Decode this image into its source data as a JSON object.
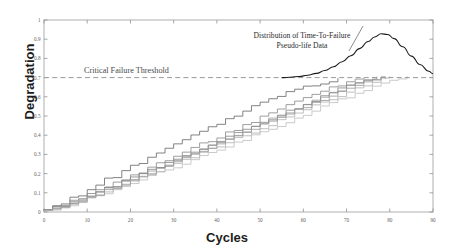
{
  "chart_data": {
    "type": "line",
    "title": "",
    "xlabel": "Cycles",
    "ylabel": "Degradation",
    "xlim": [
      0,
      90
    ],
    "ylim": [
      0,
      1
    ],
    "xticks": [
      0,
      10,
      20,
      30,
      40,
      50,
      60,
      70,
      80,
      90
    ],
    "yticks": [
      0,
      0.1,
      0.2,
      0.3,
      0.4,
      0.5,
      0.6,
      0.7,
      0.8,
      0.9,
      1
    ],
    "xtick_labels": [
      "0",
      "10",
      "20",
      "30",
      "40",
      "50",
      "60",
      "70",
      "80",
      "90"
    ],
    "ytick_labels": [
      "0",
      "0.1",
      "0.2",
      "0.3",
      "0.4",
      "0.5",
      "0.6",
      "0.7",
      "0.8",
      "0.9",
      "1"
    ],
    "grid": false,
    "legend": "none",
    "threshold": {
      "label": "Critical Failure Threshold",
      "value": 0.7,
      "style": "dashed",
      "color": "#9a9a9a"
    },
    "annotation": {
      "line1": "Distribution of Time-To-Failure",
      "line2": "Pseudo-life Data",
      "color": "#2b2b2b"
    },
    "distribution_curve": {
      "name": "Time-To-Failure density",
      "color": "#1a1a1a",
      "peak_x": 78,
      "peak_y": 0.93,
      "points": [
        [
          55,
          0.7
        ],
        [
          57,
          0.702
        ],
        [
          59,
          0.706
        ],
        [
          61,
          0.712
        ],
        [
          63,
          0.722
        ],
        [
          65,
          0.737
        ],
        [
          67,
          0.757
        ],
        [
          69,
          0.783
        ],
        [
          71,
          0.814
        ],
        [
          73,
          0.851
        ],
        [
          75,
          0.888
        ],
        [
          76.5,
          0.912
        ],
        [
          78,
          0.928
        ],
        [
          79.5,
          0.925
        ],
        [
          81,
          0.903
        ],
        [
          83,
          0.861
        ],
        [
          85,
          0.812
        ],
        [
          87,
          0.768
        ],
        [
          89,
          0.733
        ],
        [
          90,
          0.72
        ]
      ]
    },
    "series": [
      {
        "name": "unit-1",
        "color": "#6d6d6d",
        "points": [
          [
            0,
            0.012
          ],
          [
            2,
            0.03
          ],
          [
            4,
            0.048
          ],
          [
            6,
            0.072
          ],
          [
            8,
            0.09
          ],
          [
            10,
            0.118
          ],
          [
            12,
            0.14
          ],
          [
            14,
            0.168
          ],
          [
            16,
            0.183
          ],
          [
            18,
            0.214
          ],
          [
            20,
            0.238
          ],
          [
            22,
            0.258
          ],
          [
            24,
            0.285
          ],
          [
            26,
            0.3
          ],
          [
            28,
            0.332
          ],
          [
            30,
            0.352
          ],
          [
            32,
            0.372
          ],
          [
            34,
            0.398
          ],
          [
            36,
            0.42
          ],
          [
            38,
            0.44
          ],
          [
            40,
            0.462
          ],
          [
            42,
            0.487
          ],
          [
            44,
            0.503
          ],
          [
            46,
            0.528
          ],
          [
            48,
            0.548
          ],
          [
            50,
            0.568
          ],
          [
            52,
            0.588
          ],
          [
            54,
            0.607
          ],
          [
            56,
            0.625
          ],
          [
            58,
            0.641
          ],
          [
            60,
            0.65
          ],
          [
            62,
            0.66
          ],
          [
            64,
            0.672
          ],
          [
            66,
            0.682
          ],
          [
            68,
            0.7
          ]
        ]
      },
      {
        "name": "unit-2",
        "color": "#8e8e8e",
        "points": [
          [
            0,
            0.01
          ],
          [
            2,
            0.022
          ],
          [
            4,
            0.04
          ],
          [
            6,
            0.055
          ],
          [
            8,
            0.074
          ],
          [
            10,
            0.09
          ],
          [
            12,
            0.112
          ],
          [
            14,
            0.13
          ],
          [
            16,
            0.152
          ],
          [
            18,
            0.17
          ],
          [
            20,
            0.192
          ],
          [
            22,
            0.21
          ],
          [
            24,
            0.232
          ],
          [
            26,
            0.252
          ],
          [
            28,
            0.27
          ],
          [
            30,
            0.292
          ],
          [
            32,
            0.312
          ],
          [
            34,
            0.33
          ],
          [
            36,
            0.352
          ],
          [
            38,
            0.372
          ],
          [
            40,
            0.39
          ],
          [
            42,
            0.412
          ],
          [
            44,
            0.43
          ],
          [
            46,
            0.452
          ],
          [
            48,
            0.47
          ],
          [
            50,
            0.492
          ],
          [
            52,
            0.512
          ],
          [
            54,
            0.532
          ],
          [
            56,
            0.552
          ],
          [
            58,
            0.572
          ],
          [
            60,
            0.592
          ],
          [
            62,
            0.612
          ],
          [
            64,
            0.632
          ],
          [
            66,
            0.65
          ],
          [
            68,
            0.662
          ],
          [
            70,
            0.676
          ],
          [
            72,
            0.688
          ],
          [
            74,
            0.7
          ]
        ]
      },
      {
        "name": "unit-3",
        "color": "#a0a0a0",
        "points": [
          [
            0,
            0.008
          ],
          [
            2,
            0.018
          ],
          [
            4,
            0.032
          ],
          [
            6,
            0.048
          ],
          [
            8,
            0.062
          ],
          [
            10,
            0.08
          ],
          [
            12,
            0.098
          ],
          [
            14,
            0.118
          ],
          [
            16,
            0.134
          ],
          [
            18,
            0.155
          ],
          [
            20,
            0.172
          ],
          [
            22,
            0.192
          ],
          [
            24,
            0.21
          ],
          [
            26,
            0.23
          ],
          [
            28,
            0.25
          ],
          [
            30,
            0.268
          ],
          [
            32,
            0.288
          ],
          [
            34,
            0.308
          ],
          [
            36,
            0.326
          ],
          [
            38,
            0.348
          ],
          [
            40,
            0.366
          ],
          [
            42,
            0.386
          ],
          [
            44,
            0.406
          ],
          [
            46,
            0.424
          ],
          [
            48,
            0.444
          ],
          [
            50,
            0.464
          ],
          [
            52,
            0.482
          ],
          [
            54,
            0.502
          ],
          [
            56,
            0.52
          ],
          [
            58,
            0.54
          ],
          [
            60,
            0.558
          ],
          [
            62,
            0.578
          ],
          [
            64,
            0.598
          ],
          [
            66,
            0.616
          ],
          [
            68,
            0.634
          ],
          [
            70,
            0.652
          ],
          [
            72,
            0.668
          ],
          [
            74,
            0.682
          ],
          [
            76,
            0.692
          ],
          [
            78,
            0.7
          ]
        ]
      },
      {
        "name": "unit-4",
        "color": "#b4b4b4",
        "points": [
          [
            0,
            0.009
          ],
          [
            2,
            0.016
          ],
          [
            4,
            0.028
          ],
          [
            6,
            0.042
          ],
          [
            8,
            0.056
          ],
          [
            10,
            0.072
          ],
          [
            12,
            0.088
          ],
          [
            14,
            0.106
          ],
          [
            16,
            0.122
          ],
          [
            18,
            0.14
          ],
          [
            20,
            0.158
          ],
          [
            22,
            0.176
          ],
          [
            24,
            0.194
          ],
          [
            26,
            0.212
          ],
          [
            28,
            0.23
          ],
          [
            30,
            0.248
          ],
          [
            32,
            0.268
          ],
          [
            34,
            0.286
          ],
          [
            36,
            0.304
          ],
          [
            38,
            0.324
          ],
          [
            40,
            0.342
          ],
          [
            42,
            0.36
          ],
          [
            44,
            0.38
          ],
          [
            46,
            0.398
          ],
          [
            48,
            0.418
          ],
          [
            50,
            0.436
          ],
          [
            52,
            0.456
          ],
          [
            54,
            0.474
          ],
          [
            56,
            0.494
          ],
          [
            58,
            0.512
          ],
          [
            60,
            0.532
          ],
          [
            62,
            0.55
          ],
          [
            64,
            0.57
          ],
          [
            66,
            0.588
          ],
          [
            68,
            0.608
          ],
          [
            70,
            0.626
          ],
          [
            72,
            0.644
          ],
          [
            74,
            0.662
          ],
          [
            76,
            0.678
          ],
          [
            78,
            0.69
          ],
          [
            80,
            0.7
          ]
        ]
      },
      {
        "name": "unit-5",
        "color": "#8a8a8a",
        "points": [
          [
            0,
            0.011
          ],
          [
            2,
            0.02
          ],
          [
            4,
            0.034
          ],
          [
            6,
            0.05
          ],
          [
            8,
            0.066
          ],
          [
            10,
            0.084
          ],
          [
            12,
            0.102
          ],
          [
            14,
            0.122
          ],
          [
            16,
            0.138
          ],
          [
            18,
            0.158
          ],
          [
            20,
            0.178
          ],
          [
            22,
            0.196
          ],
          [
            24,
            0.216
          ],
          [
            26,
            0.236
          ],
          [
            28,
            0.254
          ],
          [
            30,
            0.274
          ],
          [
            32,
            0.292
          ],
          [
            34,
            0.312
          ],
          [
            36,
            0.33
          ],
          [
            38,
            0.35
          ],
          [
            40,
            0.37
          ],
          [
            42,
            0.388
          ],
          [
            44,
            0.408
          ],
          [
            46,
            0.426
          ],
          [
            48,
            0.446
          ],
          [
            50,
            0.466
          ],
          [
            52,
            0.484
          ],
          [
            54,
            0.504
          ],
          [
            56,
            0.524
          ],
          [
            58,
            0.542
          ],
          [
            60,
            0.56
          ],
          [
            62,
            0.58
          ],
          [
            64,
            0.6
          ],
          [
            66,
            0.618
          ],
          [
            68,
            0.638
          ],
          [
            70,
            0.656
          ],
          [
            72,
            0.672
          ],
          [
            74,
            0.686
          ],
          [
            76,
            0.694
          ],
          [
            77,
            0.7
          ]
        ]
      },
      {
        "name": "unit-6",
        "color": "#c0c0c0",
        "points": [
          [
            0,
            0.007
          ],
          [
            2,
            0.014
          ],
          [
            4,
            0.026
          ],
          [
            6,
            0.038
          ],
          [
            8,
            0.052
          ],
          [
            10,
            0.066
          ],
          [
            12,
            0.082
          ],
          [
            14,
            0.098
          ],
          [
            16,
            0.114
          ],
          [
            18,
            0.13
          ],
          [
            20,
            0.148
          ],
          [
            22,
            0.164
          ],
          [
            24,
            0.182
          ],
          [
            26,
            0.2
          ],
          [
            28,
            0.218
          ],
          [
            30,
            0.234
          ],
          [
            32,
            0.252
          ],
          [
            34,
            0.27
          ],
          [
            36,
            0.288
          ],
          [
            38,
            0.306
          ],
          [
            40,
            0.324
          ],
          [
            42,
            0.342
          ],
          [
            44,
            0.36
          ],
          [
            46,
            0.378
          ],
          [
            48,
            0.396
          ],
          [
            50,
            0.414
          ],
          [
            52,
            0.432
          ],
          [
            54,
            0.452
          ],
          [
            56,
            0.47
          ],
          [
            58,
            0.488
          ],
          [
            60,
            0.506
          ],
          [
            62,
            0.526
          ],
          [
            64,
            0.544
          ],
          [
            66,
            0.562
          ],
          [
            68,
            0.582
          ],
          [
            70,
            0.6
          ],
          [
            72,
            0.618
          ],
          [
            74,
            0.638
          ],
          [
            76,
            0.656
          ],
          [
            78,
            0.674
          ],
          [
            80,
            0.688
          ],
          [
            82,
            0.696
          ],
          [
            84,
            0.7
          ]
        ]
      },
      {
        "name": "unit-7",
        "color": "#9c9c9c",
        "points": [
          [
            0,
            0.01
          ],
          [
            2,
            0.019
          ],
          [
            4,
            0.03
          ],
          [
            6,
            0.046
          ],
          [
            8,
            0.06
          ],
          [
            10,
            0.078
          ],
          [
            12,
            0.094
          ],
          [
            14,
            0.112
          ],
          [
            16,
            0.128
          ],
          [
            18,
            0.148
          ],
          [
            20,
            0.166
          ],
          [
            22,
            0.184
          ],
          [
            24,
            0.204
          ],
          [
            26,
            0.222
          ],
          [
            28,
            0.242
          ],
          [
            30,
            0.26
          ],
          [
            32,
            0.28
          ],
          [
            34,
            0.298
          ],
          [
            36,
            0.318
          ],
          [
            38,
            0.338
          ],
          [
            40,
            0.356
          ],
          [
            42,
            0.376
          ],
          [
            44,
            0.394
          ],
          [
            46,
            0.414
          ],
          [
            48,
            0.434
          ],
          [
            50,
            0.452
          ],
          [
            52,
            0.472
          ],
          [
            54,
            0.49
          ],
          [
            56,
            0.51
          ],
          [
            58,
            0.53
          ],
          [
            60,
            0.548
          ],
          [
            62,
            0.568
          ],
          [
            64,
            0.586
          ],
          [
            66,
            0.606
          ],
          [
            68,
            0.624
          ],
          [
            70,
            0.644
          ],
          [
            72,
            0.66
          ],
          [
            74,
            0.676
          ],
          [
            76,
            0.688
          ],
          [
            78,
            0.696
          ],
          [
            79,
            0.7
          ]
        ]
      }
    ]
  }
}
